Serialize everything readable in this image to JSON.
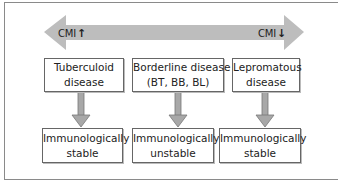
{
  "diagram": {
    "spectrum_arrow": {
      "color": "#bdbdbd",
      "left_label": "CMI",
      "left_indicator": "↑",
      "right_label": "CMI",
      "right_indicator": "↓"
    },
    "columns": [
      {
        "disease": {
          "line1": "Tuberculoid",
          "line2": "disease"
        },
        "outcome": {
          "line1": "Immunologically",
          "line2": "stable"
        }
      },
      {
        "disease": {
          "line1": "Borderline disease",
          "line2": "(BT, BB, BL)"
        },
        "outcome": {
          "line1": "Immunologically",
          "line2": "unstable"
        }
      },
      {
        "disease": {
          "line1": "Lepromatous",
          "line2": "disease"
        },
        "outcome": {
          "line1": "Immunologically",
          "line2": "stable"
        }
      }
    ]
  }
}
